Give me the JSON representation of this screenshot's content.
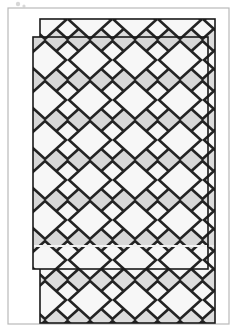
{
  "figure": {
    "title": "Diamond-lattice panel assembly line drawing",
    "canvas": {
      "width": 238,
      "height": 331,
      "background": "#ffffff"
    },
    "colors": {
      "page_background": "#ffffff",
      "outer_frame_stroke": "#b9b9b9",
      "panel_fill": "#d7d7d7",
      "panel_fill_back": "#dcdcdc",
      "panel_stroke": "#1a1a1a",
      "lattice_stroke": "#232323",
      "lattice_cell_fill": "#f7f7f7",
      "highlight_line": "#f2f2f2",
      "speck_gray": "#c9c9c9"
    },
    "outer_frame": {
      "label": "outer-frame",
      "x": 8,
      "y": 8,
      "width": 221,
      "height": 316,
      "stroke_width": 1.2
    },
    "back_panel": {
      "label": "back-panel",
      "x": 40,
      "y": 19,
      "width": 175,
      "height": 304,
      "stroke_width": 1.6,
      "note": "rear patterned panel, offset up and right"
    },
    "front_panel": {
      "label": "front-panel",
      "x": 33,
      "y": 37,
      "width": 175,
      "height": 232,
      "stroke_width": 1.6,
      "note": "front patterned panel, overlaps the rear panel"
    },
    "lattice": {
      "label": "diamond-lattice",
      "pitch_x": 45,
      "pitch_y": 40,
      "diamond_half_width": 21,
      "diamond_half_height": 19,
      "stroke_width": 2.6,
      "rows_front": 6,
      "cols_front": 4
    },
    "highlight_lines": [
      {
        "label": "front-panel-seam",
        "x1": 34,
        "y1": 246,
        "x2": 207,
        "y2": 246
      },
      {
        "label": "back-panel-seam",
        "x1": 41,
        "y1": 246,
        "x2": 214,
        "y2": 246
      }
    ],
    "specks": [
      {
        "cx": 18,
        "cy": 4,
        "r": 2.2
      },
      {
        "cx": 24,
        "cy": 6,
        "r": 1.6
      }
    ]
  }
}
